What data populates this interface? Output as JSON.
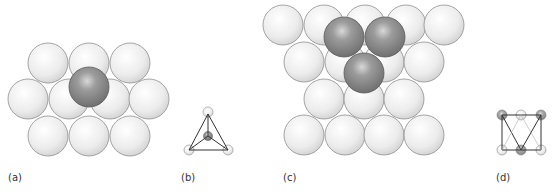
{
  "panels": [
    {
      "id": "a",
      "label": "(a)",
      "description": "single sphere in tetrahedral hole of close-packed layer"
    },
    {
      "id": "b",
      "label": "(b)",
      "description": "tetrahedral site schematic"
    },
    {
      "id": "c",
      "label": "(c)",
      "description": "three spheres forming octahedral hole over close-packed layer"
    },
    {
      "id": "d",
      "label": "(d)",
      "description": "octahedral site schematic"
    }
  ],
  "colors": {
    "light_sphere": "#e8e8e8",
    "light_sphere_edge": "#9a9a9a",
    "dark_sphere": "#8e8e8e",
    "dark_sphere_edge": "#555555",
    "line": "#333333"
  }
}
